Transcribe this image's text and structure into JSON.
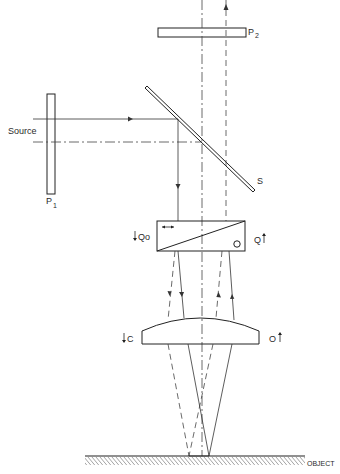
{
  "figure": {
    "type": "optical schematic (reflected-light differential interference contrast setup)",
    "colors": {
      "line": "#222222",
      "background": "#ffffff"
    },
    "labels": {
      "source": "Source",
      "polarizer": "P",
      "polarizer_sub": "1",
      "analyzer": "P",
      "analyzer_sub": "2",
      "splitter": "S",
      "prism_left": "Qo",
      "prism_right": "Q",
      "lens_left": "C",
      "lens_right": "O",
      "object": "OBJECT"
    },
    "components": [
      {
        "id": "P1",
        "kind": "polarizer plate",
        "x": 47,
        "y": 94,
        "w": 8,
        "h": 100
      },
      {
        "id": "P2",
        "kind": "analyzer plate",
        "x": 158,
        "y": 28,
        "w": 88,
        "h": 9
      },
      {
        "id": "S",
        "kind": "beam splitter",
        "from": [
          146,
          87
        ],
        "to": [
          254,
          191
        ]
      },
      {
        "id": "Q",
        "kind": "Wollaston prism",
        "x": 157,
        "y": 221,
        "w": 88,
        "h": 30
      },
      {
        "id": "C/O",
        "kind": "plano-convex lens",
        "x": 142,
        "y": 317,
        "w": 117,
        "h": 27
      },
      {
        "id": "OBJECT",
        "kind": "specimen surface",
        "y": 456,
        "x1": 85,
        "x2": 305
      }
    ],
    "rays": {
      "solid": "incident illumination path",
      "dashed": "reflected / returning path",
      "dashdot": "optical axis"
    }
  }
}
